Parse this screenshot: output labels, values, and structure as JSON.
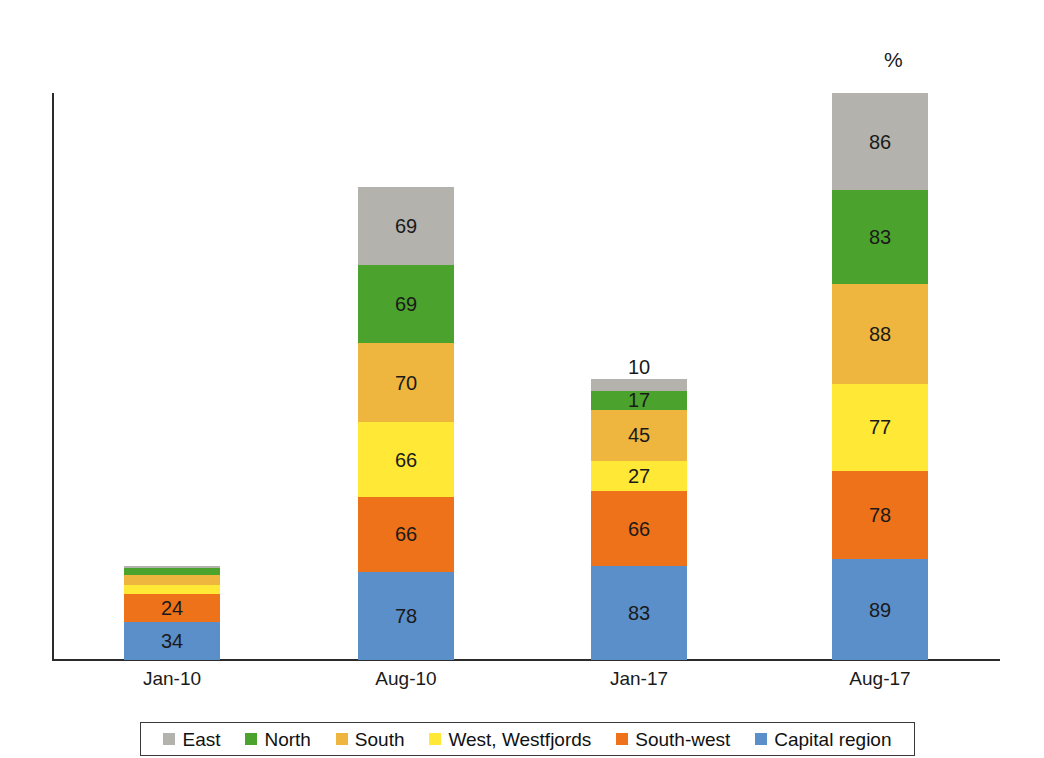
{
  "chart_data": {
    "type": "bar",
    "subtype": "stacked-bar",
    "title": "",
    "xlabel": "",
    "ylabel": "",
    "unit_label": "%",
    "categories": [
      "Jan-10",
      "Aug-10",
      "Jan-17",
      "Aug-17"
    ],
    "series": [
      {
        "name": "Capital region",
        "color": "#5b8fc9",
        "values": [
          34,
          78,
          83,
          89
        ]
      },
      {
        "name": "South-west",
        "color": "#ee7219",
        "values": [
          24,
          66,
          66,
          78
        ]
      },
      {
        "name": "West, Westfjords",
        "color": "#ffe836",
        "values": [
          8,
          66,
          27,
          77
        ]
      },
      {
        "name": "South",
        "color": "#eeb63e",
        "values": [
          9,
          70,
          45,
          88
        ]
      },
      {
        "name": "North",
        "color": "#4ba32e",
        "values": [
          6,
          69,
          17,
          83
        ]
      },
      {
        "name": "East",
        "color": "#b3b2ad",
        "values": [
          2,
          69,
          10,
          86
        ]
      }
    ],
    "stack_totals": [
      83,
      418,
      248,
      501
    ],
    "labels_shown": {
      "Jan-10": [
        "34",
        "24",
        "",
        "",
        "",
        ""
      ],
      "Aug-10": [
        "78",
        "66",
        "66",
        "70",
        "69",
        "69"
      ],
      "Jan-17": [
        "83",
        "66",
        "27",
        "45",
        "17",
        "10"
      ],
      "Aug-17": [
        "89",
        "78",
        "77",
        "88",
        "83",
        "86"
      ]
    },
    "grid": false,
    "legend_position": "bottom",
    "axis": {
      "y_axis_visible": true,
      "x_axis_visible": true,
      "tick_labels": false
    }
  },
  "legend": {
    "items": [
      {
        "label": "East",
        "color": "#b3b2ad"
      },
      {
        "label": "North",
        "color": "#4ba32e"
      },
      {
        "label": "South",
        "color": "#eeb63e"
      },
      {
        "label": "West, Westfjords",
        "color": "#ffe836"
      },
      {
        "label": "South-west",
        "color": "#ee7219"
      },
      {
        "label": "Capital region",
        "color": "#5b8fc9"
      }
    ]
  },
  "axis_labels": {
    "unit": "%",
    "x_ticks": [
      "Jan-10",
      "Aug-10",
      "Jan-17",
      "Aug-17"
    ]
  }
}
